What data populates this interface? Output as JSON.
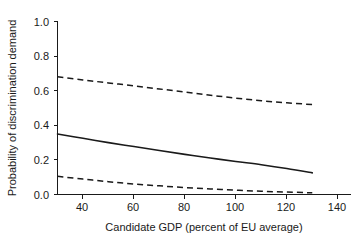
{
  "chart_data": {
    "type": "line",
    "title": "",
    "xlabel": "Candidate GDP (percent of EU average)",
    "ylabel": "Probability of discrimination demand",
    "xlim": [
      30,
      145
    ],
    "ylim": [
      0.0,
      1.0
    ],
    "xticks": [
      40,
      60,
      80,
      100,
      120,
      140
    ],
    "xtick_labels": [
      "40",
      "60",
      "80",
      "100",
      "120",
      "140"
    ],
    "yticks": [
      0.0,
      0.2,
      0.4,
      0.6,
      0.8,
      1.0
    ],
    "ytick_labels": [
      "0.0",
      "0.2",
      "0.4",
      "0.6",
      "0.8",
      "1.0"
    ],
    "grid": false,
    "legend": "none",
    "x": [
      30,
      40,
      50,
      60,
      70,
      80,
      90,
      100,
      110,
      120,
      130
    ],
    "series": [
      {
        "name": "Upper 95% confidence bound",
        "style": "dashed",
        "color": "#1a1a1a",
        "values": [
          0.68,
          0.662,
          0.645,
          0.628,
          0.61,
          0.592,
          0.574,
          0.557,
          0.542,
          0.53,
          0.52
        ]
      },
      {
        "name": "Predicted probability",
        "style": "solid",
        "color": "#1a1a1a",
        "values": [
          0.35,
          0.325,
          0.3,
          0.277,
          0.254,
          0.232,
          0.211,
          0.191,
          0.172,
          0.15,
          0.125
        ]
      },
      {
        "name": "Lower 95% confidence bound",
        "style": "dashed",
        "color": "#1a1a1a",
        "values": [
          0.105,
          0.089,
          0.074,
          0.061,
          0.05,
          0.04,
          0.032,
          0.025,
          0.019,
          0.014,
          0.01
        ]
      }
    ]
  },
  "axes": {
    "x_axis_label": "Candidate GDP (percent of EU average)",
    "y_axis_label": "Probability of discrimination demand"
  },
  "colors": {
    "ink": "#1a1a1a",
    "background": "#ffffff"
  }
}
